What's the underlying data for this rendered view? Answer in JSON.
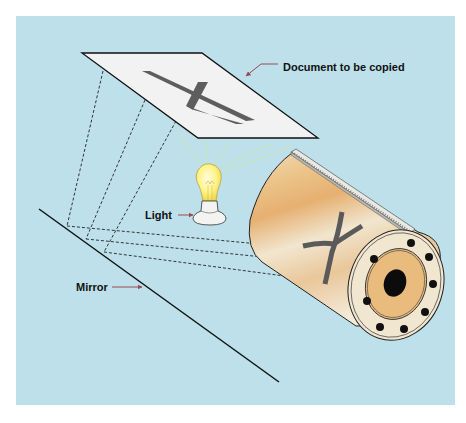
{
  "diagram": {
    "type": "photocopier-process-illustration",
    "background_color": "#bde0ea",
    "labels": {
      "document": "Document to be copied",
      "light": "Light",
      "mirror": "Mirror"
    },
    "colors": {
      "label_arrow": "#9a4a55",
      "drum_body": "#e9b773",
      "drum_highlight": "#f3eddc",
      "document_fill": "#f2f2f2",
      "letter": "#5a5a5a",
      "bulb_glow": "#fff27a",
      "light_rays": "#c9e6b0"
    },
    "elements": {
      "document_letter": "K",
      "drum_letter": "K (mirrored)",
      "bolt_count": 8
    }
  }
}
